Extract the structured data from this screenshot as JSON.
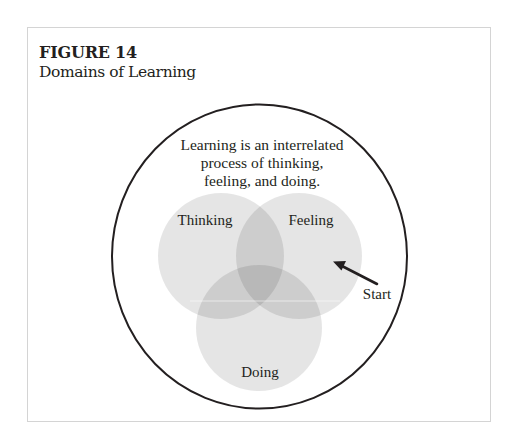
{
  "figure": {
    "number": "FIGURE 14",
    "title": "Domains of Learning"
  },
  "diagram": {
    "type": "venn",
    "caption_lines": [
      "Learning is an interrelated",
      "process of thinking,",
      "feeling, and doing."
    ],
    "sets": [
      {
        "label": "Thinking",
        "color": "#e6e6e6"
      },
      {
        "label": "Feeling",
        "color": "#e6e6e6"
      },
      {
        "label": "Doing",
        "color": "#e6e6e6"
      }
    ],
    "overlap_colors": {
      "pair": "#cfcfcf",
      "triple": "#b8b8b8"
    },
    "start_label": "Start",
    "outline_color": "#231f20",
    "arrow_color": "#231f20"
  }
}
